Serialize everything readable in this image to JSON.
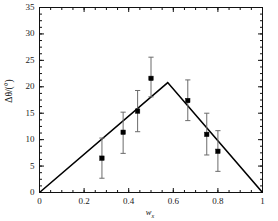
{
  "chart_data": {
    "type": "scatter",
    "title": "",
    "xlabel": "w_x",
    "ylabel": "Δθ/(°)",
    "xlim": [
      0,
      1
    ],
    "ylim": [
      0,
      35
    ],
    "grid": false,
    "legend": "none",
    "xticks": [
      0,
      0.2,
      0.4,
      0.6,
      0.8,
      1
    ],
    "xtick_labels": [
      "0",
      "0.2",
      "0.4",
      "0.6",
      "0.8",
      "1"
    ],
    "yticks": [
      0,
      5,
      10,
      15,
      20,
      25,
      30,
      35
    ],
    "ytick_labels": [
      "0",
      "5",
      "10",
      "15",
      "20",
      "25",
      "30",
      "35"
    ],
    "x_minor_tick_interval": 0.05,
    "y_minor_tick_interval": 1.25,
    "series": [
      {
        "name": "measured",
        "type": "scatter",
        "marker": "filled-square",
        "color": "#000000",
        "points": [
          {
            "x": 0.28,
            "y": 6.5,
            "yerr_low": 2.7,
            "yerr_high": 10.3
          },
          {
            "x": 0.375,
            "y": 11.4,
            "yerr_low": 7.4,
            "yerr_high": 15.2
          },
          {
            "x": 0.44,
            "y": 15.4,
            "yerr_low": 11.5,
            "yerr_high": 19.3
          },
          {
            "x": 0.5,
            "y": 21.6,
            "yerr_low": 18.1,
            "yerr_high": 25.6
          },
          {
            "x": 0.665,
            "y": 17.4,
            "yerr_low": 13.6,
            "yerr_high": 21.3
          },
          {
            "x": 0.75,
            "y": 11.0,
            "yerr_low": 7.1,
            "yerr_high": 15.0
          },
          {
            "x": 0.8,
            "y": 7.8,
            "yerr_low": 4.0,
            "yerr_high": 11.7
          }
        ]
      },
      {
        "name": "model",
        "type": "line",
        "color": "#000000",
        "points": [
          {
            "x": 0.0,
            "y": 0.0
          },
          {
            "x": 0.575,
            "y": 20.8
          },
          {
            "x": 1.0,
            "y": 0.0
          }
        ]
      }
    ]
  },
  "axes": {
    "ylabel_text": "Δθ/(°)",
    "xlabel_main": "w",
    "xlabel_sub": "x"
  }
}
